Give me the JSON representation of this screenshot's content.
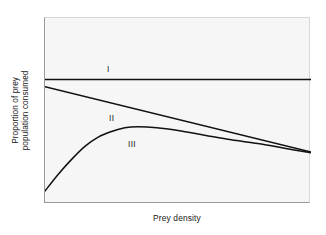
{
  "figure": {
    "background_color": "#ffffff",
    "plot_background_color": "#f6f6f6",
    "frame_color": "#9a9a9a",
    "line_color": "#111111"
  },
  "axes": {
    "ylabel_line1": "Proportion of prey",
    "ylabel_line2": "population consumed",
    "xlabel": "Prey density"
  },
  "annotations": {
    "curve_1_label": "I",
    "curve_2_label": "II",
    "curve_3_label": "III"
  },
  "chart_data": {
    "type": "line",
    "title": "",
    "subtitle": "",
    "xlabel": "Prey density",
    "ylabel": "Proportion of prey population consumed",
    "xlim": [
      0,
      1
    ],
    "ylim": [
      0,
      1
    ],
    "grid": false,
    "legend_position": "inline-curve-labels",
    "axis_ticks": {
      "x": [],
      "y": [],
      "note": "no numeric tick labels; both axes are schematic/qualitative"
    },
    "series": [
      {
        "name": "I",
        "label": "Type I functional response",
        "annotation": "I",
        "description": "Constant proportion of prey consumed, independent of prey density",
        "x": [
          0.0,
          0.1,
          0.2,
          0.3,
          0.4,
          0.5,
          0.6,
          0.7,
          0.8,
          0.9,
          1.0
        ],
        "y": [
          0.67,
          0.67,
          0.67,
          0.67,
          0.67,
          0.67,
          0.67,
          0.67,
          0.67,
          0.67,
          0.67
        ]
      },
      {
        "name": "II",
        "label": "Type II functional response",
        "annotation": "II",
        "description": "Proportion consumed declines steadily (linearly) as prey density increases",
        "x": [
          0.0,
          0.1,
          0.2,
          0.3,
          0.4,
          0.5,
          0.6,
          0.7,
          0.8,
          0.9,
          1.0
        ],
        "y": [
          0.63,
          0.59,
          0.56,
          0.52,
          0.49,
          0.45,
          0.42,
          0.38,
          0.35,
          0.31,
          0.28
        ]
      },
      {
        "name": "III",
        "label": "Type III functional response",
        "annotation": "III",
        "description": "Proportion consumed rises to a peak at intermediate prey density, then declines and converges with Type II",
        "x": [
          0.0,
          0.05,
          0.1,
          0.15,
          0.2,
          0.25,
          0.3,
          0.35,
          0.42,
          0.5,
          0.6,
          0.7,
          0.8,
          0.9,
          1.0
        ],
        "y": [
          0.07,
          0.16,
          0.24,
          0.31,
          0.36,
          0.39,
          0.41,
          0.415,
          0.41,
          0.395,
          0.37,
          0.345,
          0.325,
          0.3,
          0.275
        ]
      }
    ]
  }
}
